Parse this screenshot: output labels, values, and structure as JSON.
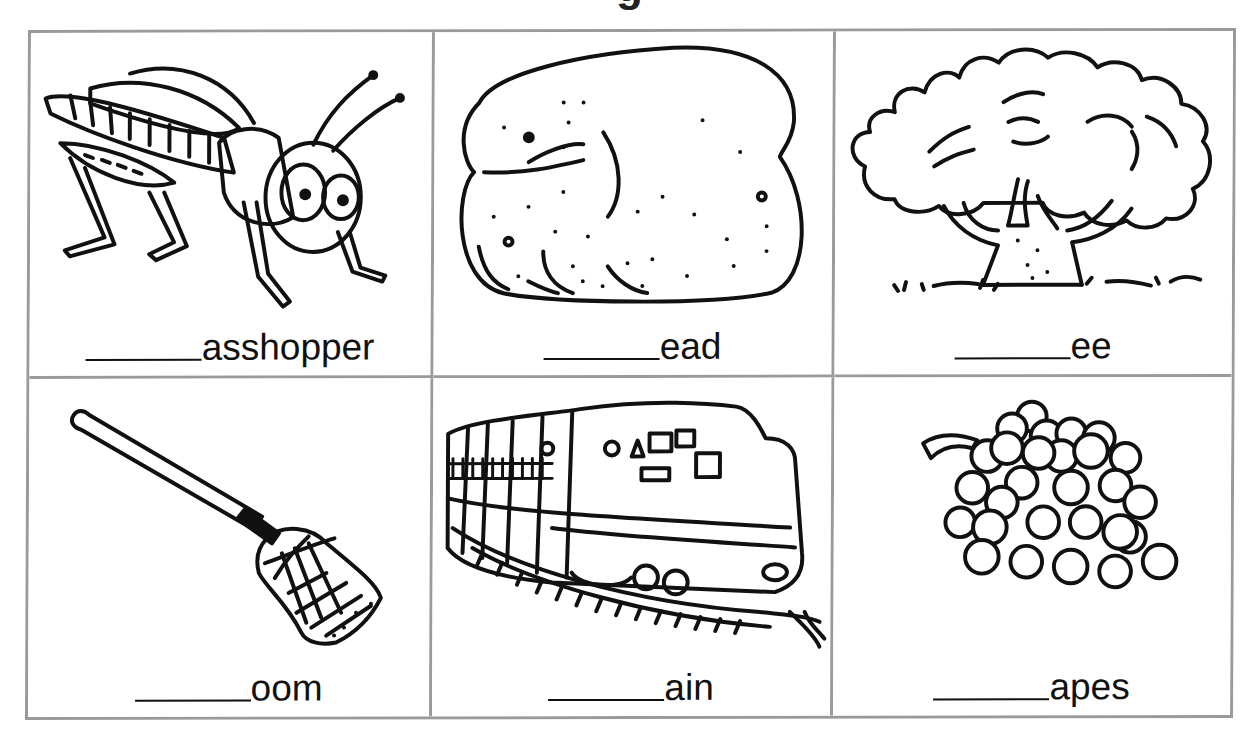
{
  "worksheet": {
    "title_fragment": "g",
    "cards": [
      {
        "picture": "grasshopper",
        "blank": "______",
        "ending": "asshopper",
        "answer_hint_icon": "grasshopper-icon"
      },
      {
        "picture": "bread",
        "blank": "______",
        "ending": "ead",
        "answer_hint_icon": "bread-icon"
      },
      {
        "picture": "tree",
        "blank": "______",
        "ending": "ee",
        "answer_hint_icon": "tree-icon"
      },
      {
        "picture": "broom",
        "blank": "______",
        "ending": "oom",
        "answer_hint_icon": "broom-icon"
      },
      {
        "picture": "train",
        "blank": "______",
        "ending": "ain",
        "answer_hint_icon": "train-icon"
      },
      {
        "picture": "grapes",
        "blank": "______",
        "ending": "apes",
        "answer_hint_icon": "grapes-icon"
      }
    ],
    "colors": {
      "grid_border": "#9a9a9a",
      "ink": "#111111",
      "background": "#ffffff"
    }
  }
}
